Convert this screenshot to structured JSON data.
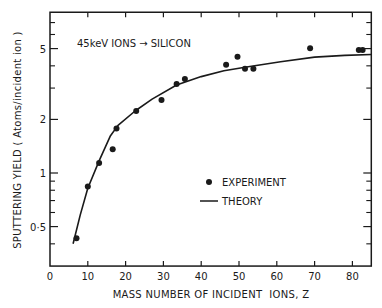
{
  "chart_data": {
    "type": "scatter",
    "title": "",
    "annotation": "45keV IONS → SILICON",
    "xlabel": "MASS NUMBER OF INCIDENT  IONS, Z",
    "ylabel": "SPUTTERING YIELD ( Atoms/incident ion )",
    "xlim": [
      0,
      85
    ],
    "ylim": [
      0.3,
      8
    ],
    "yscale": "log",
    "grid": false,
    "legend_position": "center-right",
    "x_ticks": [
      0,
      10,
      20,
      30,
      40,
      50,
      60,
      70,
      80
    ],
    "x_tick_labels": [
      "0",
      "10",
      "20",
      "30",
      "40",
      "50",
      "60",
      "70",
      "80"
    ],
    "y_ticks": [
      0.5,
      1,
      2,
      5
    ],
    "y_tick_labels": [
      "0·5",
      "1",
      "2",
      "5"
    ],
    "y_minor_ticks": [
      0.4,
      0.6,
      0.7,
      0.8,
      0.9,
      3,
      4,
      6,
      7
    ],
    "series": [
      {
        "name": "EXPERIMENT",
        "kind": "points",
        "x": [
          7,
          10,
          13,
          16.6,
          17.6,
          22.8,
          29.5,
          33.5,
          35.7,
          46.6,
          49.6,
          51.6,
          53.8,
          68.8,
          81.7,
          82.7
        ],
        "y": [
          0.43,
          0.84,
          1.14,
          1.36,
          1.78,
          2.23,
          2.57,
          3.16,
          3.38,
          4.06,
          4.5,
          3.85,
          3.85,
          5.02,
          4.9,
          4.9
        ]
      },
      {
        "name": "THEORY",
        "kind": "line",
        "x": [
          6.1,
          8,
          10,
          13,
          16,
          18,
          22.5,
          27,
          33.5,
          40,
          46,
          52,
          61,
          70,
          78,
          85
        ],
        "y": [
          0.4,
          0.58,
          0.82,
          1.17,
          1.62,
          1.85,
          2.23,
          2.6,
          3.12,
          3.48,
          3.75,
          3.94,
          4.22,
          4.48,
          4.58,
          4.63
        ]
      }
    ]
  },
  "legend": {
    "experiment_label": "EXPERIMENT",
    "theory_label": "THEORY"
  },
  "colors": {
    "ink": "#1a1a1a",
    "background": "#ffffff"
  }
}
